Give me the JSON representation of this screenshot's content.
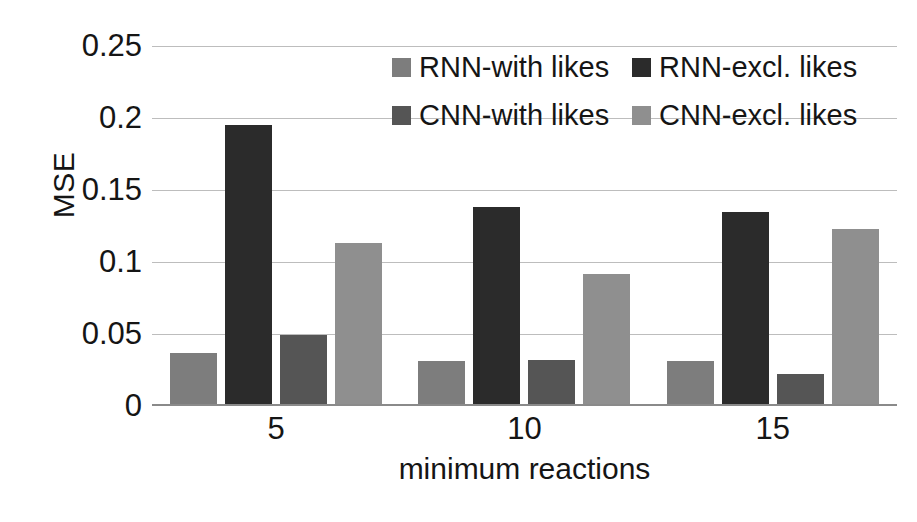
{
  "chart_data": {
    "type": "bar",
    "title": "",
    "subtitle": "",
    "xlabel": "minimum reactions",
    "ylabel": "MSE",
    "categories": [
      "5",
      "10",
      "15"
    ],
    "series": [
      {
        "name": "RNN-with likes",
        "color": "#7d7d7d",
        "values": [
          0.037,
          0.031,
          0.031
        ]
      },
      {
        "name": "RNN-excl. likes",
        "color": "#2b2b2b",
        "values": [
          0.195,
          0.138,
          0.135
        ]
      },
      {
        "name": "CNN-with likes",
        "color": "#555555",
        "values": [
          0.049,
          0.032,
          0.022
        ]
      },
      {
        "name": "CNN-excl. likes",
        "color": "#8f8f8f",
        "values": [
          0.113,
          0.092,
          0.123
        ]
      }
    ],
    "ylim": [
      0,
      0.25
    ],
    "yticks": [
      "0.25",
      "0.2",
      "0.15",
      "0.1",
      "0.05",
      "0"
    ],
    "ytick_values": [
      0.25,
      0.2,
      0.15,
      0.1,
      0.05,
      0
    ],
    "grid": "horizontal",
    "legend_position": "inside-top-right",
    "legend_layout": "2x2"
  },
  "axes": {
    "y_title": "MSE",
    "x_title": "minimum reactions"
  },
  "legend": {
    "items": [
      {
        "label": "RNN-with likes",
        "color": "#7d7d7d"
      },
      {
        "label": "RNN-excl. likes",
        "color": "#2b2b2b"
      },
      {
        "label": "CNN-with likes",
        "color": "#555555"
      },
      {
        "label": "CNN-excl. likes",
        "color": "#8f8f8f"
      }
    ]
  }
}
